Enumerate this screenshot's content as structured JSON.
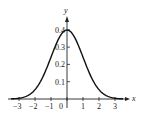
{
  "chart_data": {
    "type": "line",
    "title": "",
    "xlabel": "x",
    "ylabel": "y",
    "xlim": [
      -3.5,
      3.7
    ],
    "ylim": [
      0,
      0.45
    ],
    "grid": false,
    "legend": null,
    "x_ticks": [
      "-3",
      "-2",
      "-1",
      "0",
      "1",
      "2",
      "3"
    ],
    "y_ticks": [
      "0.1",
      "0.2",
      "0.3",
      "0.4"
    ],
    "series": [
      {
        "name": "standard normal density",
        "x": [
          -3.4,
          -3,
          -2.5,
          -2,
          -1.5,
          -1,
          -0.5,
          0,
          0.5,
          1,
          1.5,
          2,
          2.5,
          3,
          3.4
        ],
        "values": [
          0.001,
          0.004,
          0.018,
          0.054,
          0.13,
          0.242,
          0.352,
          0.399,
          0.352,
          0.242,
          0.13,
          0.054,
          0.018,
          0.004,
          0.001
        ]
      }
    ]
  },
  "style": {
    "line_color": "#111111",
    "axis_color": "#222222"
  }
}
